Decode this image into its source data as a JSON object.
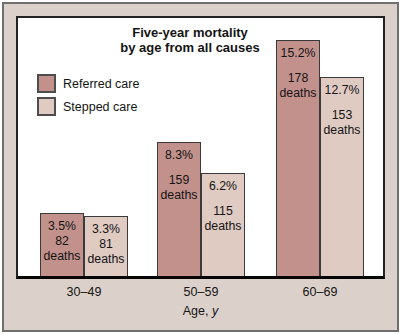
{
  "figure": {
    "title": {
      "line1": "Five-year mortality",
      "line2": "by age from all causes"
    }
  },
  "x_axis": {
    "label": "Age,",
    "variable": "y"
  },
  "colors": {
    "matte_background": "#dcd1ca",
    "referred_care": "#c2918c",
    "stepped_care": "#e0cbc3"
  },
  "chart_data": {
    "type": "bar",
    "title": "Five-year mortality by age from all causes",
    "categories": [
      "30–49",
      "50–59",
      "60–69"
    ],
    "xlabel": "Age, y",
    "ylabel": "",
    "units": "percent mortality",
    "deaths_word": "deaths",
    "legend_position": "upper-left",
    "grid": false,
    "series": [
      {
        "name": "Referred care",
        "color": "#c2918c",
        "values_pct": [
          3.5,
          8.3,
          15.2
        ],
        "deaths": [
          82,
          159,
          178
        ]
      },
      {
        "name": "Stepped care",
        "color": "#e0cbc3",
        "values_pct": [
          3.3,
          6.2,
          12.7
        ],
        "deaths": [
          81,
          115,
          153
        ]
      }
    ]
  }
}
